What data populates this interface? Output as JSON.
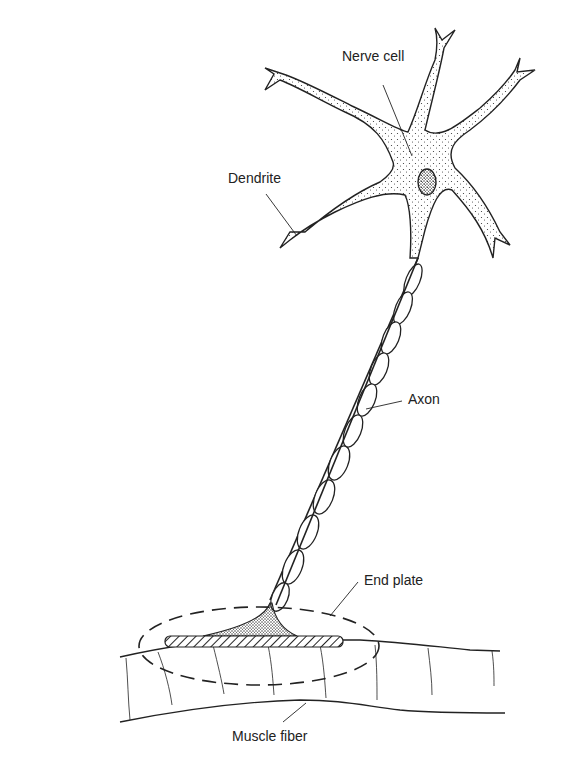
{
  "figure": {
    "cut_off_caption_text": "Figure caption (cropped, illegible)",
    "colors": {
      "ink": "#222222",
      "background": "#ffffff"
    },
    "labels": {
      "nerve_cell": "Nerve cell",
      "dendrite": "Dendrite",
      "axon": "Axon",
      "end_plate": "End plate",
      "muscle_fiber": "Muscle fiber"
    },
    "parts": [
      {
        "name": "nerve-cell-body",
        "label": "Nerve cell"
      },
      {
        "name": "dendrite",
        "label": "Dendrite"
      },
      {
        "name": "axon",
        "label": "Axon",
        "myelin_segments": 13
      },
      {
        "name": "end-plate",
        "label": "End plate"
      },
      {
        "name": "muscle-fiber",
        "label": "Muscle fiber"
      }
    ]
  }
}
